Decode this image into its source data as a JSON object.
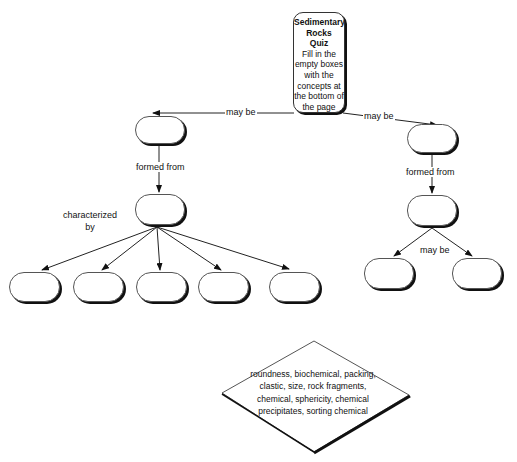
{
  "title_box": {
    "title_lines": [
      "Sedimentary",
      "Rocks",
      "Quiz"
    ],
    "instructions": "Fill in the empty boxes with the concepts at the bottom of the page"
  },
  "links": {
    "top_left": "may be",
    "top_right": "may be",
    "left_formed_from": "formed from",
    "right_formed_from": "formed from",
    "characterized_by": "characterized by",
    "right_may_be": "may be"
  },
  "empty_boxes": [
    {
      "id": "left-type",
      "value": ""
    },
    {
      "id": "right-type",
      "value": ""
    },
    {
      "id": "left-origin",
      "value": ""
    },
    {
      "id": "right-origin",
      "value": ""
    },
    {
      "id": "char-1",
      "value": ""
    },
    {
      "id": "char-2",
      "value": ""
    },
    {
      "id": "char-3",
      "value": ""
    },
    {
      "id": "char-4",
      "value": ""
    },
    {
      "id": "char-5",
      "value": ""
    },
    {
      "id": "right-sub-1",
      "value": ""
    },
    {
      "id": "right-sub-2",
      "value": ""
    }
  ],
  "word_bank": {
    "text": "roundness, biochemical, packing, clastic, size, rock fragments, chemical, sphericity, chemical precipitates, sorting chemical"
  }
}
